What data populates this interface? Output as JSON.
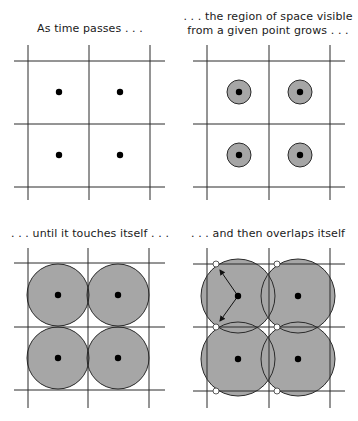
{
  "panels": [
    {
      "caption": "As time passes . . .",
      "grid": {
        "xs": [
          28,
          89,
          150
        ],
        "ys": [
          61,
          124,
          187
        ],
        "x0": 14,
        "x1": 165,
        "y0": 45,
        "y1": 200
      },
      "centers": [
        [
          59,
          92
        ],
        [
          120,
          92
        ],
        [
          59,
          155
        ],
        [
          120,
          155
        ]
      ],
      "radius": 0,
      "markers": [],
      "arrows": []
    },
    {
      "caption_line1": ". . . the region of space visible",
      "caption_line2": "from a given point grows . . .",
      "grid": {
        "xs": [
          207,
          269,
          330
        ],
        "ys": [
          61,
          124,
          187
        ],
        "x0": 193,
        "x1": 345,
        "y0": 45,
        "y1": 200
      },
      "centers": [
        [
          239,
          92
        ],
        [
          300,
          92
        ],
        [
          239,
          155
        ],
        [
          300,
          155
        ]
      ],
      "radius": 12,
      "markers": [],
      "arrows": []
    },
    {
      "caption": ". . . until it touches itself . . .",
      "grid": {
        "xs": [
          28,
          88,
          149
        ],
        "ys": [
          263,
          327,
          390
        ],
        "x0": 14,
        "x1": 165,
        "y0": 248,
        "y1": 408
      },
      "centers": [
        [
          58,
          295
        ],
        [
          118,
          295
        ],
        [
          58,
          358
        ],
        [
          118,
          358
        ]
      ],
      "radius": 31,
      "markers": [],
      "arrows": []
    },
    {
      "caption": ". . . and then overlaps itself",
      "grid": {
        "xs": [
          207,
          269,
          330
        ],
        "ys": [
          264,
          327,
          391
        ],
        "x0": 193,
        "x1": 345,
        "y0": 248,
        "y1": 408
      },
      "centers": [
        [
          238,
          296
        ],
        [
          298,
          296
        ],
        [
          238,
          359
        ],
        [
          298,
          359
        ]
      ],
      "radius": 37,
      "markers": [
        [
          216,
          264
        ],
        [
          277,
          264
        ],
        [
          216,
          327
        ],
        [
          277,
          327
        ],
        [
          216,
          391
        ],
        [
          277,
          391
        ]
      ],
      "arrows": [
        [
          [
            238,
            296
          ],
          [
            220,
            270
          ]
        ],
        [
          [
            238,
            296
          ],
          [
            220,
            321
          ]
        ]
      ]
    }
  ],
  "colors": {
    "line": "#2a2a2a",
    "disk_fill": "#a6a6a6",
    "disk_stroke": "#2a2a2a",
    "dot": "#000000",
    "marker_fill": "#ffffff"
  }
}
